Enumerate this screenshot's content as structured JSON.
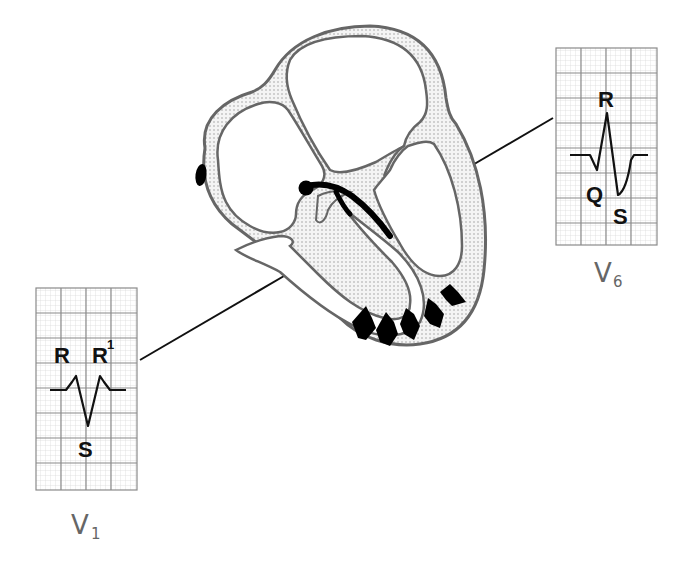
{
  "diagram": {
    "colors": {
      "background": "#ffffff",
      "outline": "#555555",
      "myocardium_fill": "#e9e9e9",
      "conduction_black": "#000000",
      "grid_minor": "#c8c8c8",
      "grid_major": "#8a8a8a",
      "lead_label": "#666666"
    }
  },
  "leads": {
    "v1": {
      "label_main": "V",
      "label_sub": "1",
      "waves": {
        "r": "R",
        "r_prime": "R",
        "r_prime_mark": "1",
        "s": "S"
      },
      "pattern": "rSR'"
    },
    "v6": {
      "label_main": "V",
      "label_sub": "6",
      "waves": {
        "r": "R",
        "q": "Q",
        "s": "S"
      },
      "pattern": "qRS"
    }
  },
  "heart": {
    "sa_node": "oval mark in right atrium",
    "conduction": "His bundle / left bundle branch (black)",
    "depolarization_arrows": 5
  }
}
